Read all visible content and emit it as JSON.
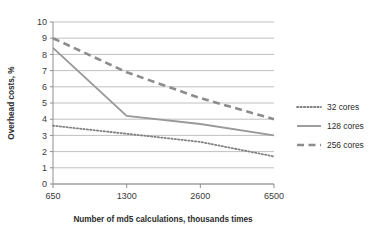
{
  "chart_data": {
    "type": "line",
    "title": "",
    "xlabel": "Number of md5 calculations, thousands times",
    "ylabel": "Overhead costs, %",
    "categories": [
      "650",
      "1300",
      "2600",
      "6500"
    ],
    "yticks": [
      "0",
      "1",
      "2",
      "3",
      "4",
      "5",
      "6",
      "7",
      "8",
      "9",
      "10"
    ],
    "ylim": [
      0,
      10
    ],
    "grid": true,
    "legend_position": "right",
    "series": [
      {
        "name": "32 cores",
        "style": "dotted",
        "color": "#808080",
        "values": [
          3.6,
          3.1,
          2.6,
          1.7
        ]
      },
      {
        "name": "128 cores",
        "style": "solid",
        "color": "#999999",
        "values": [
          8.4,
          4.2,
          3.7,
          3.0
        ]
      },
      {
        "name": "256 cores",
        "style": "dashed",
        "color": "#8c8c8c",
        "values": [
          9.0,
          6.9,
          5.3,
          4.0
        ]
      }
    ]
  },
  "axis": {
    "y_title": "Overhead costs, %",
    "x_title": "Number of md5 calculations, thousands times",
    "y_ticks": [
      "10",
      "9",
      "8",
      "7",
      "6",
      "5",
      "4",
      "3",
      "2",
      "1",
      "0"
    ],
    "x_ticks": [
      "650",
      "1300",
      "2600",
      "6500"
    ]
  },
  "legend": {
    "items": [
      {
        "label": "32 cores"
      },
      {
        "label": "128 cores"
      },
      {
        "label": "256 cores"
      }
    ]
  },
  "colors": {
    "grid": "#b0b0b0",
    "axis": "#8f8f8f",
    "series_32": "#808080",
    "series_128": "#9a9a9a",
    "series_256": "#8c8c8c",
    "text": "#2b2b2b",
    "background": "#ffffff"
  }
}
